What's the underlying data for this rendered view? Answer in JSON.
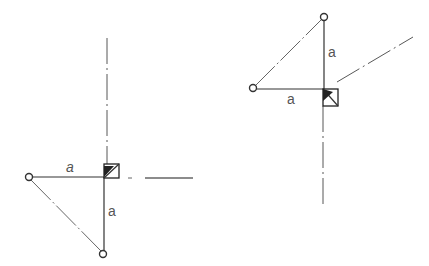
{
  "figure": {
    "left_diagram": {
      "labels": {
        "horizontal": "a",
        "vertical": "a"
      },
      "points": {
        "corner": [
          107,
          177
        ],
        "left": [
          29,
          177
        ],
        "bottom": [
          103,
          254
        ]
      }
    },
    "right_diagram": {
      "labels": {
        "vertical": "a",
        "horizontal": "a"
      },
      "points": {
        "corner": [
          324,
          89
        ],
        "top": [
          324,
          17
        ],
        "left": [
          253,
          88
        ]
      }
    },
    "colors": {
      "line": "#333333",
      "label": "#555555",
      "background": "#ffffff"
    }
  }
}
